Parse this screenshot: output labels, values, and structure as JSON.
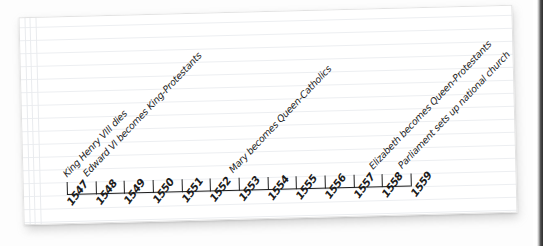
{
  "page": {
    "medium": "ruled-notebook-paper",
    "paper_color": "#ffffff",
    "rule_color": "#eceef1",
    "ink_color": "#1d1d1d"
  },
  "chart_data": {
    "type": "timeline",
    "title": "",
    "xlabel": "",
    "ylabel": "",
    "grid": false,
    "legend": null,
    "axis_range": [
      1547,
      1559
    ],
    "categories": [
      "1547",
      "1548",
      "1549",
      "1550",
      "1551",
      "1552",
      "1553",
      "1554",
      "1555",
      "1556",
      "1557",
      "1558",
      "1559"
    ],
    "tick_labels": [
      "1547",
      "1548",
      "1549",
      "1550",
      "1551",
      "1552",
      "1553",
      "1554",
      "1555",
      "1556",
      "1557",
      "1558",
      "1559"
    ],
    "values": [
      1547,
      1548,
      1549,
      1550,
      1551,
      1552,
      1553,
      1554,
      1555,
      1556,
      1557,
      1558,
      1559
    ],
    "annotations": [
      {
        "year": 1547,
        "label": "King Henry VIII dies"
      },
      {
        "year": 1547,
        "label": "Edward VI becomes King-Protestants"
      },
      {
        "year": 1553,
        "label": "Mary becomes Queen-Catholics"
      },
      {
        "year": 1558,
        "label": "Elizabeth becomes Queen-Protestants"
      },
      {
        "year": 1559,
        "label": "Parliament sets up national church"
      }
    ]
  },
  "ticks": [
    {
      "label": "1547",
      "x": 44
    },
    {
      "label": "1548",
      "x": 72.7
    },
    {
      "label": "1549",
      "x": 101.3
    },
    {
      "label": "1550",
      "x": 130
    },
    {
      "label": "1551",
      "x": 158.7
    },
    {
      "label": "1552",
      "x": 187.3
    },
    {
      "label": "1553",
      "x": 216
    },
    {
      "label": "1554",
      "x": 244.7
    },
    {
      "label": "1555",
      "x": 273.3
    },
    {
      "label": "1556",
      "x": 302
    },
    {
      "label": "1557",
      "x": 330.7
    },
    {
      "label": "1558",
      "x": 359.3
    },
    {
      "label": "1559",
      "x": 388
    }
  ],
  "events": [
    {
      "label": "King Henry VIII dies",
      "x": 46,
      "y": 162
    },
    {
      "label": "Edward VI becomes King-Protestants",
      "x": 66,
      "y": 162
    },
    {
      "label": "Mary becomes Queen-Catholics",
      "x": 212,
      "y": 162
    },
    {
      "label": "Elizabeth becomes Queen-Protestants",
      "x": 352,
      "y": 162
    },
    {
      "label": "Parliament sets up national church",
      "x": 381,
      "y": 162
    }
  ]
}
